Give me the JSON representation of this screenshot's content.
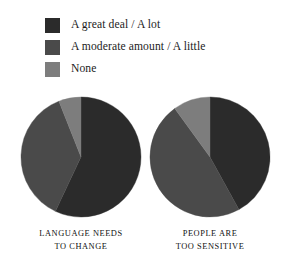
{
  "legend": {
    "items": [
      {
        "label": "A great deal / A lot",
        "color": "#2b2b2b",
        "swatch_name": "legend-swatch-great-deal"
      },
      {
        "label": "A moderate amount / A little",
        "color": "#4a4a4a",
        "swatch_name": "legend-swatch-moderate"
      },
      {
        "label": "None",
        "color": "#7d7d7d",
        "swatch_name": "legend-swatch-none"
      }
    ]
  },
  "chart_data": {
    "type": "pie",
    "title": "",
    "legend_position": "top-left",
    "categories": [
      "A great deal / A lot",
      "A moderate amount / A little",
      "None"
    ],
    "colors": [
      "#2b2b2b",
      "#4a4a4a",
      "#7d7d7d"
    ],
    "charts": [
      {
        "name": "language-needs-to-change",
        "caption_line1": "LANGUAGE NEEDS",
        "caption_line2": "TO CHANGE",
        "values": [
          57,
          37,
          6
        ]
      },
      {
        "name": "people-are-too-sensitive",
        "caption_line1": "PEOPLE ARE",
        "caption_line2": "TOO SENSITIVE",
        "values": [
          42,
          48,
          10
        ]
      }
    ]
  }
}
